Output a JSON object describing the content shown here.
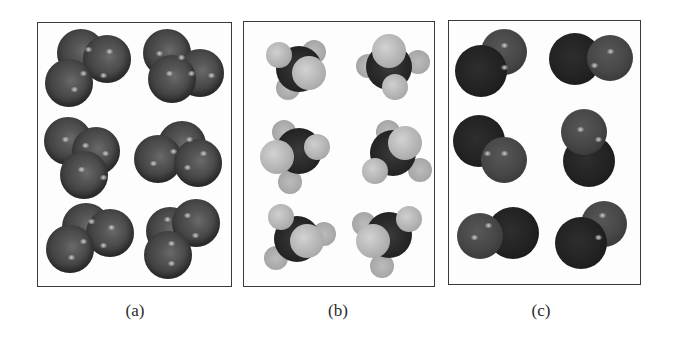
{
  "figure": {
    "type": "space-filling molecular models",
    "panels": [
      {
        "id": "a",
        "caption": "(a)",
        "description": "triatomic molecules of three identical dark atoms",
        "molecule_count": 6,
        "atom_color": "#4a4a4a"
      },
      {
        "id": "b",
        "caption": "(b)",
        "description": "tetrahedral molecules with dark central atom and light outer atoms",
        "molecule_count": 6,
        "central_atom_color": "#262626",
        "outer_atom_color": "#bcbcbc"
      },
      {
        "id": "c",
        "caption": "(c)",
        "description": "diatomic molecules of one dark and one medium-dark atom",
        "molecule_count": 6,
        "dark_atom_color": "#222222",
        "medium_atom_color": "#474747"
      }
    ]
  }
}
